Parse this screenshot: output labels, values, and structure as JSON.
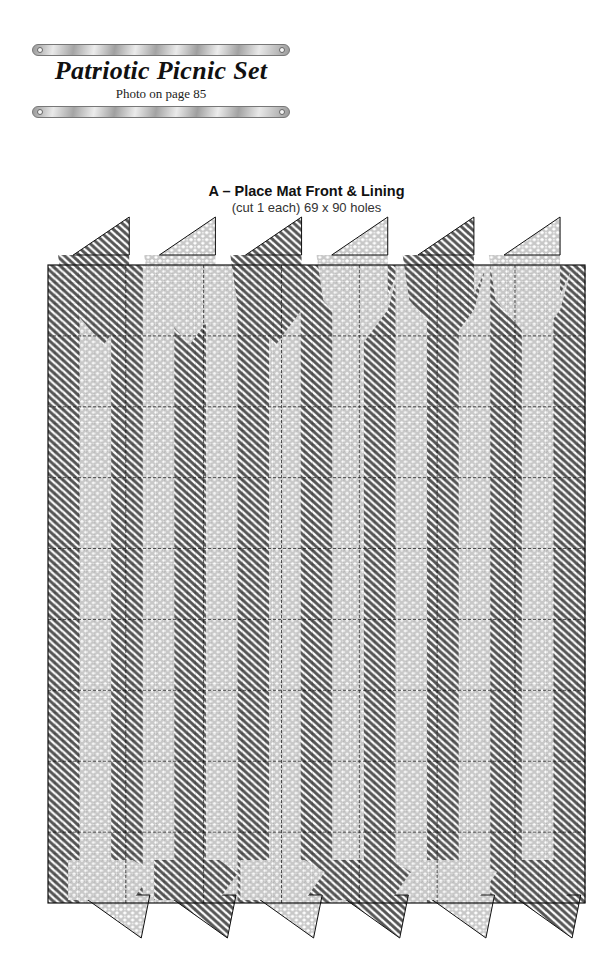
{
  "header": {
    "title": "Patriotic Picnic Set",
    "subtitle": "Photo on page 85"
  },
  "pattern": {
    "label": "A – Place Mat Front & Lining",
    "details": "(cut 1 each) 69 x 90 holes",
    "columns": 69,
    "rows": 90,
    "colors": {
      "dark_stitch": "#5a5a5a",
      "light_stitch": "#cfcfcf",
      "grid_line": "#222222",
      "background": "#ffffff"
    },
    "top_arrows": [
      "dark",
      "light",
      "dark",
      "light",
      "dark",
      "light"
    ],
    "bottom_arrows": [
      "light",
      "dark",
      "light",
      "dark",
      "light",
      "dark"
    ],
    "stripes": [
      "dark",
      "light",
      "dark",
      "light",
      "dark",
      "light",
      "dark",
      "light",
      "dark",
      "light",
      "dark",
      "light",
      "dark",
      "light",
      "dark",
      "light",
      "dark"
    ]
  }
}
